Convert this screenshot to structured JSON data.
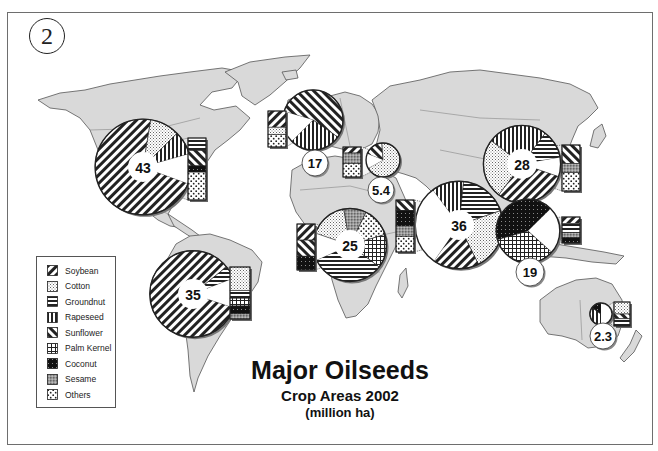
{
  "page_number": "2",
  "title": {
    "main": "Major Oilseeds",
    "sub": "Crop Areas 2002",
    "unit": "(million ha)"
  },
  "legend": [
    {
      "key": "soybean",
      "label": "Soybean"
    },
    {
      "key": "cotton",
      "label": "Cotton"
    },
    {
      "key": "groundnut",
      "label": "Groundnut"
    },
    {
      "key": "rapeseed",
      "label": "Rapeseed"
    },
    {
      "key": "sunflower",
      "label": "Sunflower"
    },
    {
      "key": "palmkernel",
      "label": "Palm Kernel"
    },
    {
      "key": "coconut",
      "label": "Coconut"
    },
    {
      "key": "sesame",
      "label": "Sesame"
    },
    {
      "key": "others",
      "label": "Others"
    }
  ],
  "colors": {
    "land": "#d9d9d9",
    "border": "#555555",
    "ink": "#1a1a1a",
    "frame": "#6e6e6e"
  },
  "chart_data": {
    "type": "pie",
    "title": "Major Oilseeds",
    "subtitle": "Crop Areas 2002 (million ha)",
    "legend_position": "bottom-left",
    "regions": [
      {
        "name": "North America",
        "total": 43,
        "label": "43",
        "slices": [
          {
            "crop": "soybean",
            "share": 0.72
          },
          {
            "crop": "cotton",
            "share": 0.1
          },
          {
            "crop": "rapeseed",
            "share": 0.08
          },
          {
            "crop": "others",
            "share": 0.1
          }
        ],
        "others_breakdown": [
          {
            "crop": "groundnut",
            "share": 0.2
          },
          {
            "crop": "sunflower",
            "share": 0.25
          },
          {
            "crop": "coconut",
            "share": 0.1
          },
          {
            "crop": "others",
            "share": 0.45
          }
        ]
      },
      {
        "name": "South America",
        "total": 35,
        "label": "35",
        "slices": [
          {
            "crop": "soybean",
            "share": 0.84
          },
          {
            "crop": "groundnut",
            "share": 0.05
          },
          {
            "crop": "others",
            "share": 0.11
          }
        ],
        "others_breakdown": [
          {
            "crop": "cotton",
            "share": 0.45
          },
          {
            "crop": "groundnut",
            "share": 0.15
          },
          {
            "crop": "palmkernel",
            "share": 0.15
          },
          {
            "crop": "coconut",
            "share": 0.15
          },
          {
            "crop": "sesame",
            "share": 0.1
          }
        ]
      },
      {
        "name": "Europe",
        "total": 17,
        "label": "17",
        "slices": [
          {
            "crop": "sunflower",
            "share": 0.55
          },
          {
            "crop": "rapeseed",
            "share": 0.28
          },
          {
            "crop": "others",
            "share": 0.17
          }
        ],
        "others_breakdown": [
          {
            "crop": "soybean",
            "share": 0.45
          },
          {
            "crop": "cotton",
            "share": 0.2
          },
          {
            "crop": "others",
            "share": 0.35
          }
        ]
      },
      {
        "name": "Middle East / North Africa",
        "total": 5.4,
        "label": "5.4",
        "slices": [
          {
            "crop": "sunflower",
            "share": 0.18
          },
          {
            "crop": "cotton",
            "share": 0.68
          },
          {
            "crop": "others",
            "share": 0.14
          }
        ],
        "others_breakdown": [
          {
            "crop": "soybean",
            "share": 0.2
          },
          {
            "crop": "sesame",
            "share": 0.35
          },
          {
            "crop": "others",
            "share": 0.45
          }
        ]
      },
      {
        "name": "Sub-Saharan Africa",
        "total": 25,
        "label": "25",
        "slices": [
          {
            "crop": "palmkernel",
            "share": 0.15
          },
          {
            "crop": "groundnut",
            "share": 0.33
          },
          {
            "crop": "others",
            "share": 0.12
          },
          {
            "crop": "cotton",
            "share": 0.17
          },
          {
            "crop": "sesame",
            "share": 0.1
          },
          {
            "crop": "others",
            "share": 0.13
          }
        ],
        "others_breakdown": [
          {
            "crop": "soybean",
            "share": 0.35
          },
          {
            "crop": "sunflower",
            "share": 0.35
          },
          {
            "crop": "coconut",
            "share": 0.3
          }
        ]
      },
      {
        "name": "South Asia",
        "total": 36,
        "label": "36",
        "slices": [
          {
            "crop": "rapeseed",
            "share": 0.12
          },
          {
            "crop": "groundnut",
            "share": 0.18
          },
          {
            "crop": "cotton",
            "share": 0.23
          },
          {
            "crop": "soybean",
            "share": 0.17
          },
          {
            "crop": "others",
            "share": 0.3
          }
        ],
        "others_breakdown": [
          {
            "crop": "sunflower",
            "share": 0.2
          },
          {
            "crop": "coconut",
            "share": 0.3
          },
          {
            "crop": "sesame",
            "share": 0.2
          },
          {
            "crop": "others",
            "share": 0.3
          }
        ]
      },
      {
        "name": "East Asia",
        "total": 28,
        "label": "28",
        "slices": [
          {
            "crop": "rapeseed",
            "share": 0.25
          },
          {
            "crop": "groundnut",
            "share": 0.12
          },
          {
            "crop": "others",
            "share": 0.08
          },
          {
            "crop": "soybean",
            "share": 0.3
          },
          {
            "crop": "cotton",
            "share": 0.25
          }
        ],
        "others_breakdown": [
          {
            "crop": "sunflower",
            "share": 0.4
          },
          {
            "crop": "sesame",
            "share": 0.2
          },
          {
            "crop": "others",
            "share": 0.4
          }
        ]
      },
      {
        "name": "Southeast Asia",
        "total": 19,
        "label": "19",
        "slices": [
          {
            "crop": "coconut",
            "share": 0.42
          },
          {
            "crop": "others",
            "share": 0.24
          },
          {
            "crop": "palmkernel",
            "share": 0.34
          }
        ],
        "others_breakdown": [
          {
            "crop": "soybean",
            "share": 0.25
          },
          {
            "crop": "groundnut",
            "share": 0.35
          },
          {
            "crop": "sesame",
            "share": 0.2
          },
          {
            "crop": "coconut",
            "share": 0.2
          }
        ]
      },
      {
        "name": "Oceania",
        "total": 2.3,
        "label": "2.3",
        "slices": [
          {
            "crop": "rapeseed",
            "share": 0.35
          },
          {
            "crop": "coconut",
            "share": 0.15
          },
          {
            "crop": "others",
            "share": 0.5
          }
        ],
        "others_breakdown": [
          {
            "crop": "cotton",
            "share": 0.5
          },
          {
            "crop": "sunflower",
            "share": 0.2
          },
          {
            "crop": "groundnut",
            "share": 0.3
          }
        ]
      }
    ]
  }
}
